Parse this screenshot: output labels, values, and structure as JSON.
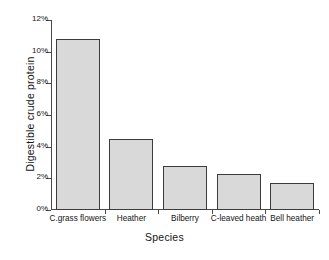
{
  "chart_data": {
    "type": "bar",
    "title": "",
    "subtitle": "",
    "xlabel": "Species",
    "ylabel": "Digestible crude protein",
    "categories": [
      "C.grass flowers",
      "Heather",
      "Bilberry",
      "C-leaved heath",
      "Bell heather"
    ],
    "values": [
      10.8,
      4.5,
      2.8,
      2.3,
      1.7
    ],
    "value_unit": "%",
    "ylim": [
      0,
      12
    ],
    "ytick_values": [
      0,
      2,
      4,
      6,
      8,
      10,
      12
    ],
    "ytick_labels": [
      "0%",
      "2%",
      "4%",
      "6%",
      "8%",
      "10%",
      "12%"
    ],
    "grid": false,
    "legend": null,
    "legend_position": "none",
    "annotations": [],
    "bar_fill_color": "#d9d9d9",
    "bar_border_color": "#3c3c3c",
    "axis_color": "#4a4a4a",
    "background_color": "#ffffff"
  }
}
